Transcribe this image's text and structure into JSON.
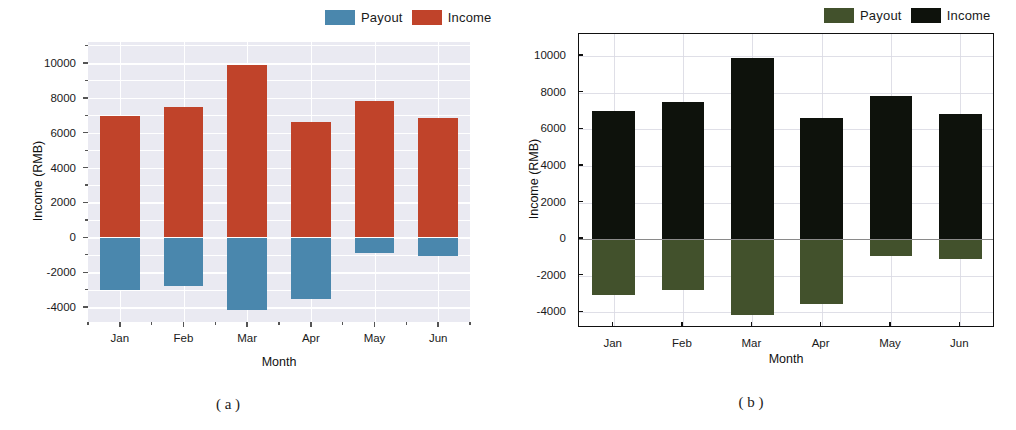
{
  "figure": {
    "captions": [
      {
        "text": "( a )"
      },
      {
        "text": "( b )"
      }
    ]
  },
  "panels": [
    {
      "id": "panel-a",
      "style": "seaborn-darkgrid",
      "background": "#eaeaf2",
      "legend": {
        "items": [
          {
            "label": "Payout",
            "color": "#4a87ad"
          },
          {
            "label": "Income",
            "color": "#c0432a"
          }
        ]
      },
      "chart_data": {
        "type": "bar",
        "title": "",
        "xlabel": "Month",
        "ylabel": "Income (RMB)",
        "categories": [
          "Jan",
          "Feb",
          "Mar",
          "Apr",
          "May",
          "Jun"
        ],
        "series": [
          {
            "name": "Income",
            "color": "#c0432a",
            "values": [
              6980,
              7500,
              9880,
              6600,
              7820,
              6850
            ]
          },
          {
            "name": "Payout",
            "color": "#4a87ad",
            "values": [
              -3030,
              -2800,
              -4150,
              -3560,
              -900,
              -1060
            ]
          }
        ],
        "ylim": [
          -4850,
          11200
        ],
        "yticks": [
          10000,
          8000,
          6000,
          4000,
          2000,
          0,
          -2000,
          -4000
        ],
        "ytick_labels": [
          "10000",
          "8000",
          "6000",
          "4000",
          "2000",
          "0",
          "-2000",
          "-4000"
        ],
        "yminor_step": 1000,
        "grid": true,
        "legend_position": "above-right",
        "stacked": true,
        "zero_baseline": 0
      }
    },
    {
      "id": "panel-b",
      "style": "classic-framed",
      "background": "#ffffff",
      "legend": {
        "items": [
          {
            "label": "Payout",
            "color": "#42512c"
          },
          {
            "label": "Income",
            "color": "#0e120c"
          }
        ]
      },
      "chart_data": {
        "type": "bar",
        "title": "",
        "xlabel": "Month",
        "ylabel": "Income (RMB)",
        "categories": [
          "Jan",
          "Feb",
          "Mar",
          "Apr",
          "May",
          "Jun"
        ],
        "series": [
          {
            "name": "Income",
            "color": "#0e120c",
            "values": [
              6980,
              7500,
              9880,
              6600,
              7820,
              6850
            ]
          },
          {
            "name": "Payout",
            "color": "#42512c",
            "values": [
              -3030,
              -2800,
              -4150,
              -3560,
              -900,
              -1060
            ]
          }
        ],
        "ylim": [
          -4850,
          11200
        ],
        "yticks": [
          10000,
          8000,
          6000,
          4000,
          2000,
          0,
          -2000,
          -4000
        ],
        "ytick_labels": [
          "10000",
          "8000",
          "6000",
          "4000",
          "2000",
          "0",
          "-2000",
          "-4000"
        ],
        "yminor_step": 1000,
        "grid": true,
        "legend_position": "above-right",
        "stacked": true,
        "zero_baseline": 0
      }
    }
  ]
}
